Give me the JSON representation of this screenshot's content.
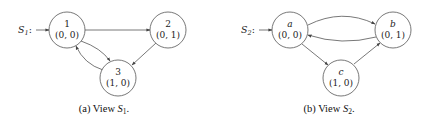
{
  "figures": [
    {
      "id": "a",
      "caption": {
        "prefix": "(a) View ",
        "symbol": "S",
        "subscript": "1",
        "suffix": "."
      },
      "start_label": {
        "symbol": "S",
        "subscript": "1",
        "suffix": ":"
      },
      "nodes": [
        {
          "id": "1",
          "value": "(0, 0)",
          "italic": false
        },
        {
          "id": "2",
          "value": "(0, 1)",
          "italic": false
        },
        {
          "id": "3",
          "value": "(1, 0)",
          "italic": false
        }
      ],
      "edges": [
        {
          "from": "start",
          "to": "1"
        },
        {
          "from": "1",
          "to": "2"
        },
        {
          "from": "2",
          "to": "3"
        },
        {
          "from": "1",
          "to": "3"
        },
        {
          "from": "3",
          "to": "1"
        }
      ]
    },
    {
      "id": "b",
      "caption": {
        "prefix": "(b) View ",
        "symbol": "S",
        "subscript": "2",
        "suffix": "."
      },
      "start_label": {
        "symbol": "S",
        "subscript": "2",
        "suffix": ":"
      },
      "nodes": [
        {
          "id": "a",
          "value": "(0, 0)",
          "italic": true
        },
        {
          "id": "b",
          "value": "(0, 1)",
          "italic": true
        },
        {
          "id": "c",
          "value": "(1, 0)",
          "italic": true
        }
      ],
      "edges": [
        {
          "from": "start",
          "to": "a"
        },
        {
          "from": "a",
          "to": "b"
        },
        {
          "from": "b",
          "to": "a"
        },
        {
          "from": "a",
          "to": "c"
        },
        {
          "from": "c",
          "to": "b"
        }
      ]
    }
  ]
}
